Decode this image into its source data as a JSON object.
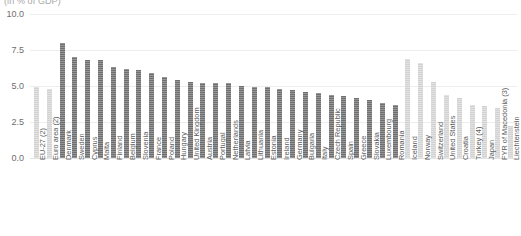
{
  "subtitle": "(in % of GDP)",
  "colors": {
    "bar_dark": "#6f6f6f",
    "bar_light": "#d2d2d2",
    "gridline": "#ededed",
    "tick_text": "#6e6e6e",
    "category_text": "#5c5c5c",
    "subtitle_text": "#a8a8a8",
    "background": "#ffffff"
  },
  "chart_data": {
    "type": "bar",
    "title": "",
    "subtitle": "(in % of GDP)",
    "xlabel": "",
    "ylabel": "",
    "ylim": [
      0.0,
      10.0
    ],
    "yticks": [
      "0.0",
      "2.5",
      "5.0",
      "7.5",
      "10.0"
    ],
    "ytick_values": [
      0.0,
      2.5,
      5.0,
      7.5,
      10.0
    ],
    "grid": true,
    "legend": false,
    "categories": [
      "EU-27 (2)",
      "Euro area (2)",
      "Denmark",
      "Sweden",
      "Cyprus",
      "Malta",
      "Finland",
      "Belgium",
      "Slovenia",
      "France",
      "Poland",
      "Hungary",
      "United Kingdom",
      "Austria",
      "Portugal",
      "Netherlands",
      "Latvia",
      "Lithuania",
      "Estonia",
      "Ireland",
      "Germany",
      "Bulgaria",
      "Italy",
      "Czech Republic",
      "Spain",
      "Greece",
      "Slovakia",
      "Luxembourg",
      "Romania",
      "Iceland",
      "Norway",
      "Switzerland",
      "United States",
      "Croatia",
      "Turkey (4)",
      "Japan",
      "FYR of Macedonia (3)",
      "Liechtenstein"
    ],
    "values": [
      4.9,
      4.8,
      8.0,
      7.0,
      6.8,
      6.8,
      6.3,
      6.2,
      6.1,
      5.9,
      5.6,
      5.4,
      5.3,
      5.2,
      5.2,
      5.2,
      5.0,
      4.9,
      4.9,
      4.8,
      4.7,
      4.6,
      4.5,
      4.4,
      4.3,
      4.2,
      4.0,
      3.8,
      3.7,
      6.9,
      6.6,
      5.3,
      4.4,
      4.2,
      3.7,
      3.6,
      3.5,
      2.2
    ],
    "series": [
      {
        "name": "Reference values",
        "values": [
          4.9,
          4.8,
          8.0,
          7.0,
          6.8,
          6.8,
          6.3,
          6.2,
          6.1,
          5.9,
          5.6,
          5.4,
          5.3,
          5.2,
          5.2,
          5.2,
          5.0,
          4.9,
          4.9,
          4.8,
          4.7,
          4.6,
          4.5,
          4.4,
          4.3,
          4.2,
          4.0,
          3.8,
          3.7,
          6.9,
          6.6,
          5.3,
          4.4,
          4.2,
          3.7,
          3.6,
          3.5,
          2.2
        ]
      }
    ],
    "bar_styles": [
      "light",
      "light",
      "dark",
      "dark",
      "dark",
      "dark",
      "dark",
      "dark",
      "dark",
      "dark",
      "dark",
      "dark",
      "dark",
      "dark",
      "dark",
      "dark",
      "dark",
      "dark",
      "dark",
      "dark",
      "dark",
      "dark",
      "dark",
      "dark",
      "dark",
      "dark",
      "dark",
      "dark",
      "dark",
      "light",
      "light",
      "light",
      "light",
      "light",
      "light",
      "light",
      "light",
      "light"
    ]
  }
}
